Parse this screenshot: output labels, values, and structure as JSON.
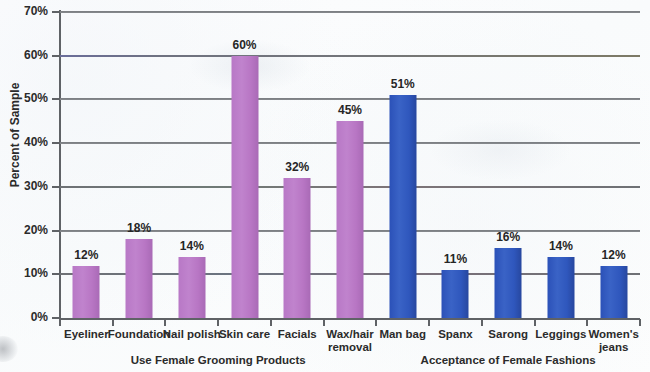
{
  "chart_data": {
    "type": "bar",
    "title": "",
    "subtitle": "",
    "xlabel": "",
    "ylabel": "Percent of Sample",
    "ylim": [
      0,
      70
    ],
    "ytick_labels": [
      "0%",
      "10%",
      "20%",
      "30%",
      "40%",
      "50%",
      "60%",
      "70%"
    ],
    "ytick_values": [
      0,
      10,
      20,
      30,
      40,
      50,
      60,
      70
    ],
    "grid": "horizontal",
    "legend": "none",
    "categories": [
      "Eyeliner",
      "Foundation",
      "Nail polish",
      "Skin care",
      "Facials",
      "Wax/hair\nremoval",
      "Man bag",
      "Spanx",
      "Sarong",
      "Leggings",
      "Women's\njeans"
    ],
    "values": [
      12,
      18,
      14,
      60,
      32,
      45,
      51,
      11,
      16,
      14,
      12
    ],
    "value_labels": [
      "12%",
      "18%",
      "14%",
      "60%",
      "32%",
      "45%",
      "51%",
      "11%",
      "16%",
      "14%",
      "12%"
    ],
    "bar_colors": [
      "#b878c6",
      "#b878c6",
      "#b878c6",
      "#b878c6",
      "#b878c6",
      "#b878c6",
      "#2b51b8",
      "#2b51b8",
      "#2b51b8",
      "#2b51b8",
      "#2b51b8"
    ],
    "groups": [
      {
        "label": "Use Female Grooming Products",
        "color": "#b878c6",
        "category_start": 0,
        "category_end": 5
      },
      {
        "label": "Acceptance of Female Fashions",
        "color": "#2b51b8",
        "category_start": 6,
        "category_end": 10
      }
    ]
  },
  "colors": {
    "purple_bar": "#b878c6",
    "blue_bar": "#2b51b8",
    "gridline": "#6e7175",
    "axis": "#5f6266",
    "text": "#2b2b2b",
    "background": "#fbfcfd"
  }
}
